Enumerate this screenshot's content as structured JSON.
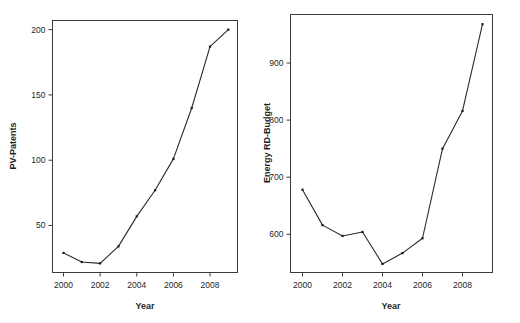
{
  "figure": {
    "width": 520,
    "height": 323,
    "background": "#ffffff",
    "line_color": "#2a2a2a",
    "marker_color": "#1a1a1a",
    "axis_color": "#3c3c3c"
  },
  "chart_data": [
    {
      "type": "line",
      "panel": "left",
      "title": "",
      "xlabel": "Year",
      "ylabel": "PV-Patents",
      "x": [
        2000,
        2001,
        2002,
        2003,
        2004,
        2005,
        2006,
        2007,
        2008,
        2009
      ],
      "values": [
        29,
        22,
        21,
        34,
        57,
        77,
        101,
        140,
        187,
        200
      ],
      "xlim": [
        1999.4,
        2009.5
      ],
      "ylim": [
        14,
        207
      ],
      "xticks": [
        2000,
        2002,
        2004,
        2006,
        2008
      ],
      "xticklabels": [
        "2000",
        "2002",
        "2004",
        "2006",
        "2008"
      ],
      "yticks": [
        50,
        100,
        150,
        200
      ],
      "yticklabels": [
        "50",
        "100",
        "150",
        "200"
      ],
      "grid": false,
      "legend": "none",
      "markers": true
    },
    {
      "type": "line",
      "panel": "right",
      "title": "",
      "xlabel": "Year",
      "ylabel": "Energy RD-Budget",
      "x": [
        2000,
        2001,
        2002,
        2003,
        2004,
        2005,
        2006,
        2007,
        2008,
        2009
      ],
      "values": [
        678,
        616,
        597,
        604,
        548,
        567,
        593,
        750,
        816,
        968
      ],
      "xlim": [
        1999.4,
        2009.5
      ],
      "ylim": [
        533,
        985
      ],
      "xticks": [
        2000,
        2002,
        2004,
        2006,
        2008
      ],
      "xticklabels": [
        "2000",
        "2002",
        "2004",
        "2006",
        "2008"
      ],
      "yticks": [
        600,
        700,
        800,
        900
      ],
      "yticklabels": [
        "600",
        "700",
        "800",
        "900"
      ],
      "grid": false,
      "legend": "none",
      "markers": true
    }
  ]
}
